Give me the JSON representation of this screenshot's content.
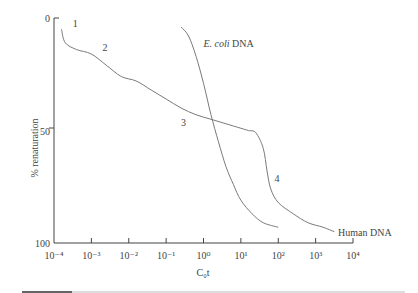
{
  "chart_data": {
    "type": "line",
    "title": "",
    "xlabel": "C₀t",
    "ylabel": "% renaturation",
    "xscale": "log",
    "xlim": [
      -4,
      4
    ],
    "ylim": [
      0,
      100
    ],
    "y_inverted": true,
    "grid": false,
    "x_ticks": [
      "10⁻⁴",
      "10⁻³",
      "10⁻²",
      "10⁻¹",
      "10⁰",
      "10¹",
      "10²",
      "10³",
      "10⁴"
    ],
    "x_tick_exponents": [
      -4,
      -3,
      -2,
      -1,
      0,
      1,
      2,
      3,
      4
    ],
    "y_ticks": [
      0,
      50,
      100
    ],
    "series": [
      {
        "name": "Human DNA",
        "x_log10": [
          -3.8,
          -3.7,
          -3.4,
          -3.0,
          -2.6,
          -2.2,
          -1.8,
          -1.4,
          -1.0,
          -0.6,
          -0.2,
          0.2,
          0.6,
          1.0,
          1.2,
          1.4,
          1.6,
          1.7,
          1.8,
          2.0,
          2.4,
          2.8,
          3.2,
          3.5
        ],
        "values": [
          5,
          11,
          14,
          16,
          21,
          26,
          28,
          32,
          36,
          40,
          43,
          45,
          47,
          49,
          50,
          51,
          58,
          68,
          76,
          82,
          87,
          91,
          93,
          95
        ]
      },
      {
        "name": "E. coli DNA",
        "x_log10": [
          -0.6,
          -0.4,
          -0.2,
          0.0,
          0.2,
          0.4,
          0.6,
          0.8,
          1.0,
          1.3,
          1.6,
          2.0
        ],
        "values": [
          4,
          8,
          17,
          29,
          43,
          55,
          66,
          74,
          81,
          87,
          91,
          93
        ]
      }
    ],
    "annotations": [
      {
        "text": "1",
        "x_log10": -3.5,
        "y": 2
      },
      {
        "text": "2",
        "x_log10": -2.7,
        "y": 13
      },
      {
        "text": "3",
        "x_log10": -0.6,
        "y": 46
      },
      {
        "text": "4",
        "x_log10": 1.9,
        "y": 71
      },
      {
        "text": "E. coli DNA",
        "x_log10": 0.0,
        "y": 11
      },
      {
        "text": "Human DNA",
        "x_log10": 3.6,
        "y": 95
      }
    ]
  }
}
